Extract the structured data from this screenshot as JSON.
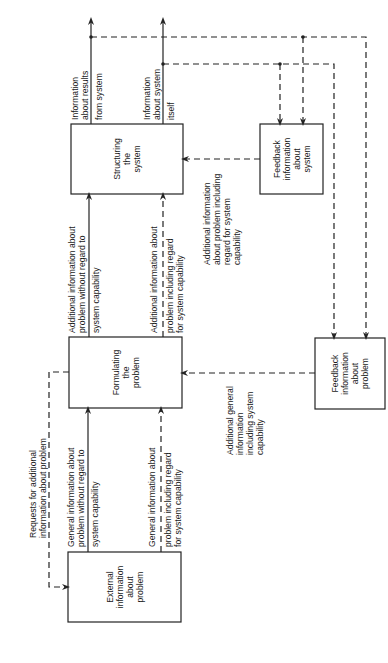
{
  "diagram": {
    "boxes": {
      "structuring": [
        "Structuring",
        "the",
        "system"
      ],
      "feedback_system": [
        "Feedback",
        "information",
        "about",
        "system"
      ],
      "formulating": [
        "Formulating",
        "the",
        "problem"
      ],
      "feedback_problem": [
        "Feedback",
        "information",
        "about",
        "problem"
      ],
      "external": [
        "External",
        "information",
        "about",
        "problem"
      ]
    },
    "labels": {
      "results_out": [
        "Information",
        "about results",
        "from system"
      ],
      "system_out": [
        "Information",
        "about system",
        "itself"
      ],
      "add_without": [
        "Additional information about",
        "problem without regard to",
        "system capability"
      ],
      "add_including": [
        "Additional information about",
        "problem including regard",
        "for system capability"
      ],
      "feedback_to_structuring": [
        "Additional information",
        "about problem including",
        "regard for system",
        "capability"
      ],
      "feedback_to_formulating": [
        "Additional general",
        "information",
        "including system",
        "capability"
      ],
      "requests": [
        "Requests for additional",
        "information about problem"
      ],
      "gen_without": [
        "General information about",
        "problem without regard to",
        "system capability"
      ],
      "gen_including": [
        "General information about",
        "problem including regard",
        "for system capability"
      ]
    }
  }
}
